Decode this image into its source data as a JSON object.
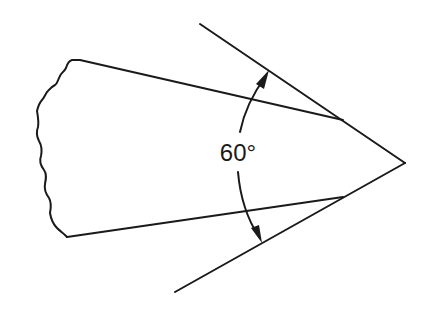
{
  "diagram": {
    "angle_label": "60°",
    "colors": {
      "line": "#1a1a1a",
      "background": "#ffffff"
    },
    "elements": {
      "tip": {
        "x": 405,
        "y": 163
      },
      "upper_tangent": {
        "x1": 200,
        "y1": 24,
        "x2": 405,
        "y2": 163
      },
      "lower_tangent": {
        "x1": 175,
        "y1": 292,
        "x2": 405,
        "y2": 163
      },
      "upper_body_edge": {
        "x1": 80,
        "y1": 60,
        "x2": 343,
        "y2": 120
      },
      "lower_body_edge": {
        "x1": 67,
        "y1": 237,
        "x2": 343,
        "y2": 197
      },
      "angle_arc": {
        "start": {
          "x": 269,
          "y": 70
        },
        "end": {
          "x": 262,
          "y": 243
        }
      }
    }
  }
}
